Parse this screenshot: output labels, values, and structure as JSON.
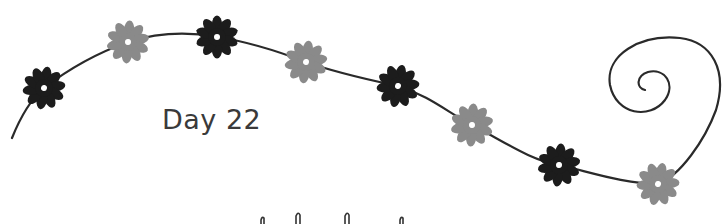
{
  "page": {
    "label": "Day 22"
  },
  "colors": {
    "background": "#ffffff",
    "vine": "#2a2a2a",
    "flower_dark": "#1c1c1c",
    "flower_light": "#8a8a8a",
    "text": "#3a3a3a"
  },
  "flowers": [
    {
      "tone": "dark",
      "x": 44,
      "y": 88
    },
    {
      "tone": "light",
      "x": 128,
      "y": 42
    },
    {
      "tone": "dark",
      "x": 217,
      "y": 37
    },
    {
      "tone": "light",
      "x": 306,
      "y": 62
    },
    {
      "tone": "dark",
      "x": 398,
      "y": 86
    },
    {
      "tone": "light",
      "x": 472,
      "y": 125
    },
    {
      "tone": "dark",
      "x": 559,
      "y": 165
    },
    {
      "tone": "light",
      "x": 658,
      "y": 184
    }
  ]
}
